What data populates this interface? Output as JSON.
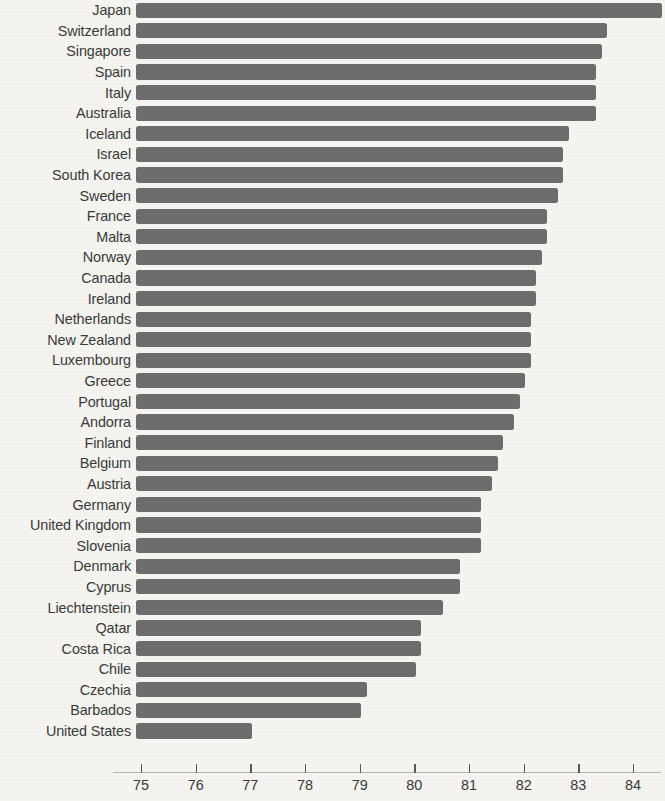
{
  "chart_data": {
    "type": "bar",
    "orientation": "horizontal",
    "title": "",
    "subtitle": "",
    "xlabel": "",
    "ylabel": "",
    "xlim": [
      74.6,
      84.8
    ],
    "grid": false,
    "legend": null,
    "bar_color": "#6e6e6e",
    "background_color": "#f7f6f3",
    "axis_tick_labels": [
      "75",
      "76",
      "77",
      "78",
      "79",
      "80",
      "81",
      "82",
      "83",
      "84"
    ],
    "axis_tick_values": [
      75,
      76,
      77,
      78,
      79,
      80,
      81,
      82,
      83,
      84
    ],
    "categories": [
      "Japan",
      "Switzerland",
      "Singapore",
      "Spain",
      "Italy",
      "Australia",
      "Iceland",
      "Israel",
      "South Korea",
      "Sweden",
      "France",
      "Malta",
      "Norway",
      "Canada",
      "Ireland",
      "Netherlands",
      "New Zealand",
      "Luxembourg",
      "Greece",
      "Portugal",
      "Andorra",
      "Finland",
      "Belgium",
      "Austria",
      "Germany",
      "United Kingdom",
      "Slovenia",
      "Denmark",
      "Cyprus",
      "Liechtenstein",
      "Qatar",
      "Costa Rica",
      "Chile",
      "Czechia",
      "Barbados",
      "United States"
    ],
    "values": [
      84.6,
      83.6,
      83.5,
      83.4,
      83.4,
      83.4,
      82.9,
      82.8,
      82.8,
      82.7,
      82.5,
      82.5,
      82.4,
      82.3,
      82.3,
      82.2,
      82.2,
      82.2,
      82.1,
      82.0,
      81.9,
      81.7,
      81.6,
      81.5,
      81.3,
      81.3,
      81.3,
      80.9,
      80.9,
      80.6,
      80.2,
      80.2,
      80.1,
      79.2,
      79.1,
      77.1
    ]
  }
}
